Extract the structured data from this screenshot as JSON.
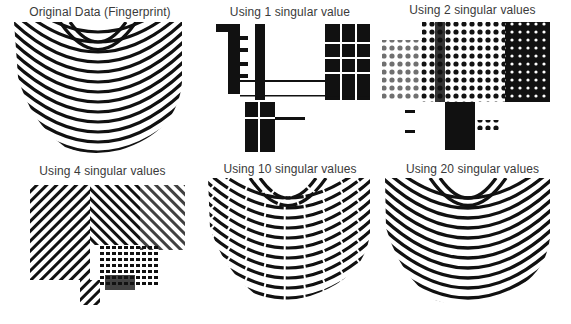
{
  "figure": {
    "panels": [
      {
        "title": "Original Data (Fingerprint)",
        "rank": "full"
      },
      {
        "title": "Using 1 singular value",
        "rank": 1
      },
      {
        "title": "Using 2 singular values",
        "rank": 2
      },
      {
        "title": "Using 4 singular values",
        "rank": 4
      },
      {
        "title": "Using 10 singular values",
        "rank": 10
      },
      {
        "title": "Using 20 singular values",
        "rank": 20
      }
    ],
    "colors": {
      "ink": "#111111",
      "background": "#ffffff",
      "title": "#3a3a3a"
    }
  }
}
